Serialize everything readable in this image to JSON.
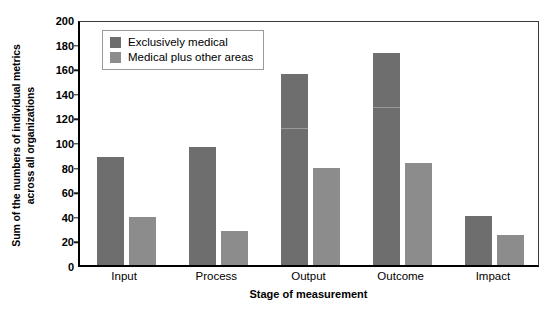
{
  "chart_data": {
    "type": "bar",
    "title": "",
    "xlabel": "Stage of measurement",
    "ylabel": "Sum of the numbers of individual metrics across all organizations",
    "ylabel_lines": [
      "Sum of the numbers of individual metrics",
      "across all organizations"
    ],
    "categories": [
      "Input",
      "Process",
      "Output",
      "Outcome",
      "Impact"
    ],
    "series": [
      {
        "name": "Exclusively medical",
        "color": "#6e6e6e",
        "values": [
          88,
          96,
          155,
          172,
          40
        ]
      },
      {
        "name": "Medical plus other areas",
        "color": "#8c8c8c",
        "values": [
          39,
          28,
          79,
          83,
          24
        ]
      }
    ],
    "ylim": [
      0,
      200
    ],
    "ytick_values": [
      0,
      20,
      40,
      60,
      80,
      100,
      120,
      140,
      160,
      180,
      200
    ],
    "ytick_labels": [
      "0",
      "20",
      "40",
      "60",
      "80",
      "100",
      "120",
      "140",
      "160",
      "180",
      "200"
    ],
    "grid": false,
    "legend_position": "upper left inside plot area",
    "axis_color": "#000000",
    "background_color": "#ffffff"
  },
  "legend": {
    "entries": [
      {
        "label": "Exclusively medical",
        "color": "#6e6e6e"
      },
      {
        "label": "Medical plus other areas",
        "color": "#8c8c8c"
      }
    ]
  }
}
